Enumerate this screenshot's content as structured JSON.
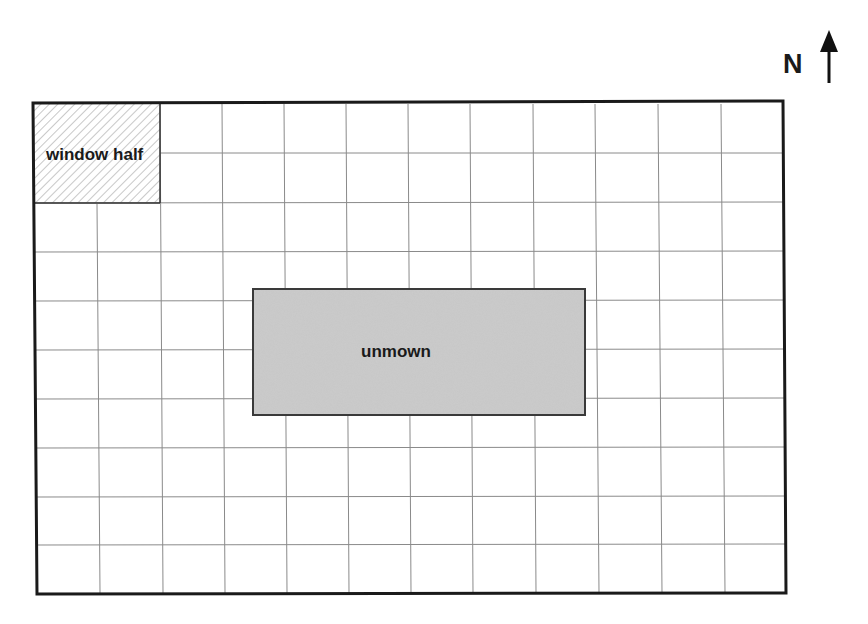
{
  "diagram": {
    "type": "lawn-plan-grid",
    "compass": {
      "label": "N",
      "icon": "north-arrow-icon"
    },
    "grid": {
      "columns": 12,
      "rows": 10,
      "outer_border_color": "#1a1a1a",
      "grid_line_color": "#8a8a8a"
    },
    "regions": [
      {
        "id": "window-half",
        "label": "window half",
        "fill": "hatched",
        "cols": [
          0,
          2
        ],
        "rows": [
          0,
          2
        ]
      },
      {
        "id": "unmown",
        "label": "unmown",
        "fill": "#c8c8c8",
        "cols": [
          3.5,
          8.8
        ],
        "rows": [
          3.8,
          6.4
        ]
      }
    ]
  }
}
